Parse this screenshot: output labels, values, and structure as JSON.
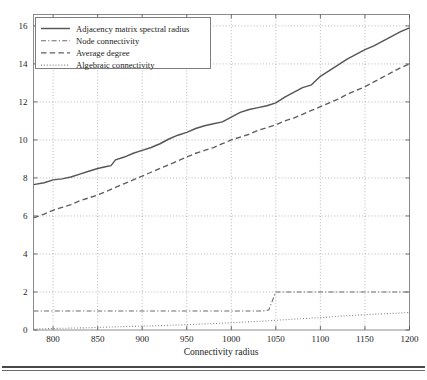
{
  "figure": {
    "caption_rule": "horizontal-rule",
    "background": "#ffffff"
  },
  "chart_data": {
    "type": "line",
    "title": "",
    "xlabel": "Connectivity radius",
    "ylabel": "",
    "xlim": [
      778,
      1200
    ],
    "ylim": [
      0,
      16.6
    ],
    "xticks": [
      800,
      850,
      900,
      950,
      1000,
      1050,
      1100,
      1150,
      1200
    ],
    "yticks": [
      0,
      2,
      4,
      6,
      8,
      10,
      12,
      14,
      16
    ],
    "xtick_labels": [
      "800",
      "850",
      "900",
      "950",
      "1000",
      "1050",
      "1100",
      "1150",
      "1200"
    ],
    "ytick_labels": [
      "0",
      "2",
      "4",
      "6",
      "8",
      "10",
      "12",
      "14",
      "16"
    ],
    "grid": true,
    "legend_position": "upper-left",
    "colors": {
      "spectral_radius": "#565656",
      "node_connectivity": "#6b6b6b",
      "average_degree": "#5e5e5e",
      "algebraic_connectivity": "#838383"
    },
    "series": [
      {
        "name": "Adjacency matrix spectral radius",
        "dash": "solid",
        "color": "#565656",
        "x": [
          778,
          790,
          800,
          810,
          820,
          830,
          840,
          850,
          860,
          865,
          870,
          880,
          890,
          900,
          910,
          920,
          930,
          940,
          950,
          960,
          970,
          980,
          990,
          1000,
          1010,
          1020,
          1030,
          1040,
          1050,
          1060,
          1070,
          1080,
          1090,
          1100,
          1110,
          1120,
          1130,
          1140,
          1150,
          1160,
          1170,
          1180,
          1190,
          1200
        ],
        "y": [
          7.65,
          7.75,
          7.9,
          7.95,
          8.05,
          8.2,
          8.35,
          8.5,
          8.6,
          8.65,
          8.95,
          9.1,
          9.3,
          9.45,
          9.6,
          9.8,
          10.05,
          10.25,
          10.4,
          10.6,
          10.75,
          10.85,
          10.95,
          11.2,
          11.45,
          11.6,
          11.7,
          11.8,
          11.95,
          12.25,
          12.5,
          12.75,
          12.9,
          13.35,
          13.65,
          13.95,
          14.25,
          14.5,
          14.75,
          14.95,
          15.2,
          15.45,
          15.7,
          15.9
        ]
      },
      {
        "name": "Node connectivity",
        "dash": "dashdot",
        "color": "#6b6b6b",
        "x": [
          778,
          900,
          1000,
          1035,
          1042,
          1050,
          1060,
          1100,
          1150,
          1200
        ],
        "y": [
          1,
          1,
          1,
          1,
          1.05,
          2,
          2,
          2,
          2,
          2
        ]
      },
      {
        "name": "Average degree",
        "dash": "dashed",
        "color": "#5e5e5e",
        "x": [
          778,
          790,
          800,
          810,
          820,
          830,
          840,
          850,
          860,
          870,
          880,
          890,
          900,
          910,
          920,
          930,
          940,
          950,
          960,
          970,
          980,
          990,
          1000,
          1010,
          1020,
          1030,
          1040,
          1050,
          1060,
          1070,
          1080,
          1090,
          1100,
          1110,
          1120,
          1130,
          1140,
          1150,
          1160,
          1170,
          1180,
          1190,
          1200
        ],
        "y": [
          5.9,
          6.1,
          6.3,
          6.45,
          6.6,
          6.8,
          6.95,
          7.1,
          7.3,
          7.5,
          7.7,
          7.9,
          8.1,
          8.3,
          8.5,
          8.7,
          8.9,
          9.1,
          9.3,
          9.45,
          9.6,
          9.8,
          10.0,
          10.15,
          10.3,
          10.5,
          10.65,
          10.8,
          11.0,
          11.15,
          11.35,
          11.55,
          11.75,
          11.95,
          12.15,
          12.4,
          12.6,
          12.8,
          13.05,
          13.3,
          13.55,
          13.8,
          14.0
        ]
      },
      {
        "name": "Algebraic connectivity",
        "dash": "dotted",
        "color": "#838383",
        "x": [
          778,
          800,
          820,
          840,
          860,
          880,
          900,
          920,
          940,
          960,
          980,
          1000,
          1020,
          1040,
          1060,
          1080,
          1100,
          1120,
          1140,
          1160,
          1180,
          1200
        ],
        "y": [
          0.05,
          0.08,
          0.1,
          0.12,
          0.15,
          0.18,
          0.2,
          0.23,
          0.26,
          0.3,
          0.34,
          0.38,
          0.43,
          0.48,
          0.54,
          0.6,
          0.65,
          0.72,
          0.78,
          0.83,
          0.87,
          0.92
        ]
      }
    ]
  }
}
